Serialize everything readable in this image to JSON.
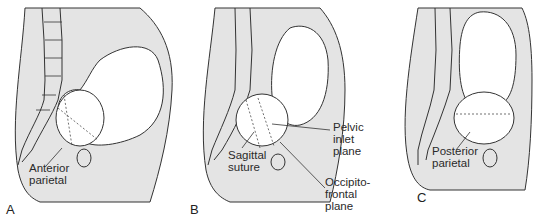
{
  "figure": {
    "colors": {
      "tissue": "#e4e4e4",
      "outline": "#333333",
      "background": "#ffffff"
    },
    "panels": [
      {
        "letter": "A",
        "labels": [
          {
            "line1": "Anterior",
            "line2": "parietal"
          }
        ]
      },
      {
        "letter": "B",
        "labels": [
          {
            "line1": "Sagittal",
            "line2": "suture"
          },
          {
            "line1": "Pelvic",
            "line2": "inlet",
            "line3": "plane"
          },
          {
            "line1": "Occipito-",
            "line2": "frontal",
            "line3": "plane"
          }
        ]
      },
      {
        "letter": "C",
        "labels": [
          {
            "line1": "Posterior",
            "line2": "parietal"
          }
        ]
      }
    ]
  }
}
